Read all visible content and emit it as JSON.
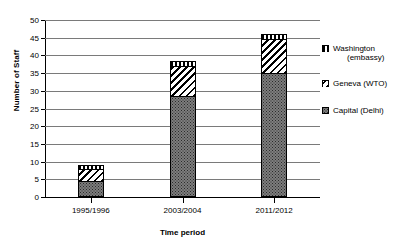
{
  "chart_data": {
    "type": "bar",
    "stacked": true,
    "title": "",
    "xlabel": "Time period",
    "ylabel": "Number of Staff",
    "categories": [
      "1995/1996",
      "2003/2004",
      "2011/2012"
    ],
    "series": [
      {
        "name": "Capital (Delhi)",
        "values": [
          4.5,
          28.5,
          35
        ]
      },
      {
        "name": "Geneva (WTO)",
        "values": [
          3.5,
          8.5,
          9.5
        ]
      },
      {
        "name": "Washington (embassy)",
        "values": [
          1,
          1.5,
          1.5
        ]
      }
    ],
    "totals": [
      9,
      38.5,
      46
    ],
    "ylim": [
      0,
      50
    ],
    "ytick_step": 5,
    "yticks": [
      0,
      5,
      10,
      15,
      20,
      25,
      30,
      35,
      40,
      45,
      50
    ],
    "grid": true,
    "legend_position": "right"
  },
  "legend": {
    "items": [
      {
        "label": "Washington",
        "sublabel": "(embassy)",
        "pattern": "vertical-stripes"
      },
      {
        "label": "Geneva (WTO)",
        "sublabel": "",
        "pattern": "diagonal-stripes"
      },
      {
        "label": "Capital (Delhi)",
        "sublabel": "",
        "pattern": "dotted"
      }
    ]
  }
}
